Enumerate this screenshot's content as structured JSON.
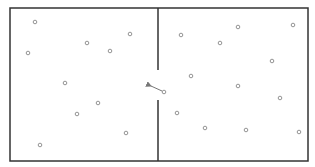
{
  "diagram": {
    "colors": {
      "wall": "#333333",
      "particle_stroke": "#888888",
      "arrow": "#777777",
      "background": "#ffffff"
    },
    "box": {
      "x": 10,
      "y": 8,
      "width": 298,
      "height": 153
    },
    "partition": {
      "x": 158,
      "top_segment": [
        8,
        70
      ],
      "bottom_segment": [
        100,
        161
      ]
    },
    "particles_left": [
      {
        "x": 35,
        "y": 22
      },
      {
        "x": 28,
        "y": 53
      },
      {
        "x": 87,
        "y": 43
      },
      {
        "x": 110,
        "y": 51
      },
      {
        "x": 130,
        "y": 34
      },
      {
        "x": 65,
        "y": 83
      },
      {
        "x": 98,
        "y": 103
      },
      {
        "x": 77,
        "y": 114
      },
      {
        "x": 126,
        "y": 133
      },
      {
        "x": 40,
        "y": 145
      }
    ],
    "particles_right": [
      {
        "x": 181,
        "y": 35
      },
      {
        "x": 220,
        "y": 43
      },
      {
        "x": 238,
        "y": 27
      },
      {
        "x": 293,
        "y": 25
      },
      {
        "x": 272,
        "y": 61
      },
      {
        "x": 191,
        "y": 76
      },
      {
        "x": 238,
        "y": 86
      },
      {
        "x": 177,
        "y": 113
      },
      {
        "x": 280,
        "y": 98
      },
      {
        "x": 205,
        "y": 128
      },
      {
        "x": 246,
        "y": 130
      },
      {
        "x": 299,
        "y": 132
      }
    ],
    "moving_particle": {
      "x": 164,
      "y": 92
    },
    "arrow": {
      "x1": 162,
      "y1": 91,
      "x2": 151,
      "y2": 86
    }
  }
}
